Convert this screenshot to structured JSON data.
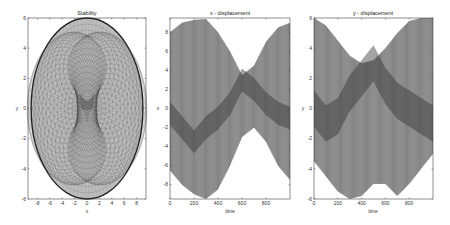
{
  "chart_data": [
    {
      "type": "line",
      "id": "stability",
      "title": "Stability",
      "xlabel": "x",
      "ylabel": "y",
      "xlim": [
        -9.5,
        9.5
      ],
      "ylim": [
        -6,
        6
      ],
      "xticks": [
        -8,
        -6,
        -4,
        -2,
        0,
        2,
        4,
        6,
        8
      ],
      "yticks": [
        -6,
        -4,
        -2,
        0,
        2,
        4,
        6
      ],
      "description": "Dense rosette-like phase trajectory filling an ellipse of semi-axes ~9 (x) and ~6 (y), with a concentrated core near origin",
      "series": [
        {
          "name": "trajectory",
          "envelope_a": 9,
          "envelope_b": 6,
          "color": "#333333"
        }
      ],
      "grid": false
    },
    {
      "type": "line",
      "id": "x-displacement",
      "title": "x - displacement",
      "xlabel": "time",
      "ylabel": "x",
      "xlim": [
        0,
        1000
      ],
      "ylim": [
        -9.5,
        9.5
      ],
      "xticks": [
        0,
        200,
        400,
        600,
        800
      ],
      "yticks": [
        -8,
        -6,
        -4,
        -2,
        0,
        2,
        4,
        6,
        8
      ],
      "series": [
        {
          "name": "x(t) fast oscillation",
          "color": "#222222",
          "t": [
            0,
            100,
            200,
            300,
            400,
            500,
            600,
            700,
            800,
            900,
            1000
          ],
          "upper": [
            8,
            9,
            9.3,
            9.4,
            8,
            6,
            3.5,
            4.5,
            7,
            8.5,
            9
          ],
          "lower": [
            -6.5,
            -8,
            -9,
            -9.5,
            -8.5,
            -6,
            -3,
            -2,
            -3.5,
            -6,
            -7.5
          ],
          "band_center": [
            -0.5,
            -2,
            -3.5,
            -2,
            -1,
            0.5,
            3,
            2,
            0.5,
            -0.5,
            -1
          ]
        }
      ],
      "grid": false
    },
    {
      "type": "line",
      "id": "y-displacement",
      "title": "y - displacement",
      "xlabel": "time",
      "ylabel": "y",
      "xlim": [
        0,
        1000
      ],
      "ylim": [
        -6,
        6
      ],
      "xticks": [
        0,
        200,
        400,
        600,
        800
      ],
      "yticks": [
        -6,
        -4,
        -2,
        0,
        2,
        4,
        6
      ],
      "series": [
        {
          "name": "y(t) fast oscillation",
          "color": "#222222",
          "t": [
            0,
            100,
            200,
            300,
            400,
            500,
            600,
            700,
            800,
            900,
            1000
          ],
          "upper": [
            6,
            5.5,
            4.5,
            3.5,
            3,
            3.2,
            4,
            5,
            5.8,
            6,
            6
          ],
          "lower": [
            -3.5,
            -4.5,
            -5.5,
            -6,
            -5.8,
            -5,
            -5,
            -5.8,
            -5,
            -4,
            -3
          ],
          "band_center": [
            0,
            -1,
            -0.5,
            1,
            2,
            3,
            1.5,
            0.5,
            0,
            -0.5,
            -1
          ]
        }
      ],
      "grid": false
    }
  ]
}
